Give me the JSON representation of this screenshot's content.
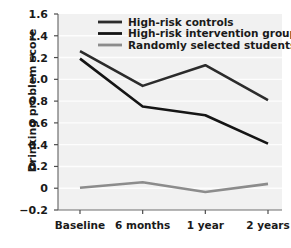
{
  "chart_data": {
    "type": "line",
    "title": "",
    "xlabel": "",
    "ylabel": "Drinking problem score",
    "categories": [
      "Baseline",
      "6 months",
      "1 year",
      "2 years"
    ],
    "ylim": [
      -0.2,
      1.6
    ],
    "yticks": [
      "1.6",
      "1.4",
      "1.2",
      "1.0",
      "0.8",
      "0.6",
      "0.4",
      "0.2",
      "0",
      "-0.2"
    ],
    "ytick_values": [
      1.6,
      1.4,
      1.2,
      1.0,
      0.8,
      0.6,
      0.4,
      0.2,
      0,
      -0.2
    ],
    "grid": true,
    "legend_position": "top-center",
    "series": [
      {
        "name": "High-risk controls",
        "color": "#2b2b2b",
        "values": [
          1.26,
          0.94,
          1.13,
          0.81
        ]
      },
      {
        "name": "High-risk intervention group",
        "color": "#151515",
        "values": [
          1.19,
          0.75,
          0.67,
          0.41
        ]
      },
      {
        "name": "Randomly selected students",
        "color": "#8c8c8c",
        "values": [
          0.005,
          0.055,
          -0.035,
          0.04
        ]
      }
    ]
  },
  "axes": {
    "y_axis_title": "Drinking problem score"
  },
  "colors": {
    "plot_background": "#f1f1f1",
    "gridline": "#fdfdfd",
    "axis": "#6e6e6e",
    "text": "#1a1a1a"
  }
}
